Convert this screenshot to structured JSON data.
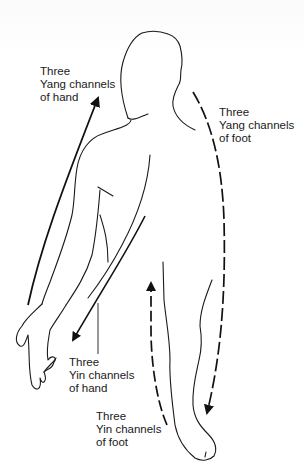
{
  "figure": {
    "colors": {
      "background": "#ffffff",
      "outline": "#1a1a1a",
      "arrow": "#111111",
      "text": "#1a1a1a"
    }
  },
  "labels": {
    "yang_hand": {
      "line1": "Three",
      "line2": "Yang channels",
      "line3": "of hand",
      "arrow_style": "solid",
      "direction": "hand-to-head (upward)"
    },
    "yang_foot": {
      "line1": "Three",
      "line2": "Yang channels",
      "line3": "of foot",
      "arrow_style": "dashed",
      "direction": "head-to-foot (downward)"
    },
    "yin_hand": {
      "line1": "Three",
      "line2": "Yin channels",
      "line3": "of hand",
      "arrow_style": "solid",
      "direction": "chest-to-hand (downward)"
    },
    "yin_foot": {
      "line1": "Three",
      "line2": "Yin channels",
      "line3": "of foot",
      "arrow_style": "dashed",
      "direction": "foot-to-chest (upward)"
    }
  }
}
